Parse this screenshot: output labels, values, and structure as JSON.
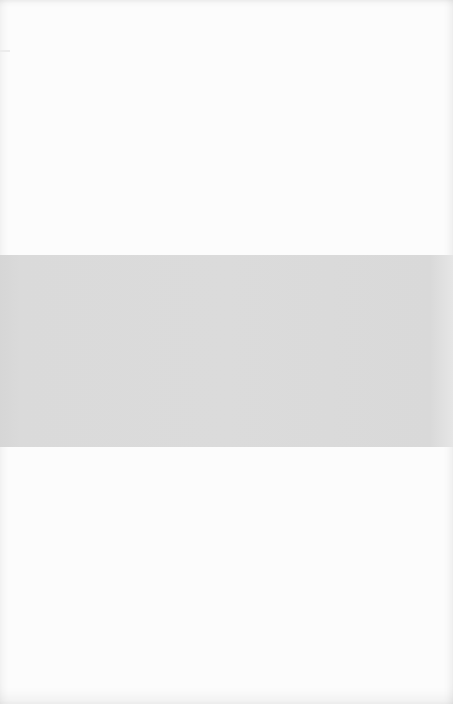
{
  "page": {
    "background_color": "#fcfcfc",
    "band": {
      "color": "#dadada",
      "top": 255,
      "height": 192
    },
    "bleed_through_text": ""
  }
}
